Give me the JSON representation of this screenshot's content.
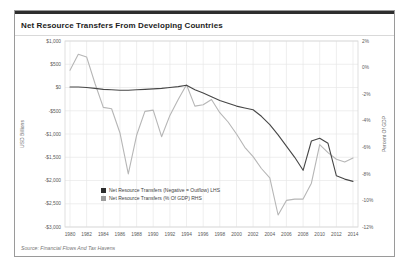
{
  "card": {
    "title": "Net Resource Transfers From Developing Countries",
    "source_note": "Source: Financial Flows And Tax Havens",
    "accent_color": "#2e2e2e",
    "border_color": "#9a9a9a"
  },
  "chart_data": {
    "type": "line",
    "title": "Net Resource Transfers From Developing Countries",
    "grid": true,
    "legend_position": "inside-lower-left",
    "x": [
      1980,
      1981,
      1982,
      1983,
      1984,
      1985,
      1986,
      1987,
      1988,
      1989,
      1990,
      1991,
      1992,
      1993,
      1994,
      1995,
      1996,
      1997,
      1998,
      1999,
      2000,
      2001,
      2002,
      2003,
      2004,
      2005,
      2006,
      2007,
      2008,
      2009,
      2010,
      2011,
      2012,
      2013,
      2014
    ],
    "x_tick_labels": [
      "1980",
      "1982",
      "1984",
      "1986",
      "1988",
      "1990",
      "1992",
      "1994",
      "1996",
      "1998",
      "2000",
      "2002",
      "2004",
      "2006",
      "2008",
      "2010",
      "2012",
      "2014"
    ],
    "left_axis": {
      "title": "USD Billions",
      "tick_labels": [
        "$1,000",
        "$500",
        "$0",
        "-$500",
        "-$1,000",
        "-$1,500",
        "-$2,000",
        "-$2,500",
        "-$3,000"
      ],
      "tick_values": [
        1000,
        500,
        0,
        -500,
        -1000,
        -1500,
        -2000,
        -2500,
        -3000
      ],
      "max": 1000,
      "min": -3000
    },
    "right_axis": {
      "title": "Percent Of GDP",
      "tick_labels": [
        "2%",
        "0%",
        "-2%",
        "-4%",
        "-6%",
        "-8%",
        "-10%",
        "-12%"
      ],
      "tick_values": [
        2,
        0,
        -2,
        -4,
        -6,
        -8,
        -10,
        -12
      ],
      "max": 2,
      "min": -12
    },
    "series": [
      {
        "name": "Net Resource Transfers (Negative = Outflow) LHS",
        "axis": "left",
        "unit": "USD billions",
        "color": "#474747",
        "values": [
          10,
          10,
          0,
          -20,
          -40,
          -50,
          -60,
          -60,
          -50,
          -40,
          -30,
          -20,
          0,
          20,
          50,
          -50,
          -120,
          -200,
          -280,
          -340,
          -400,
          -440,
          -480,
          -620,
          -800,
          -1020,
          -1260,
          -1500,
          -1780,
          -1150,
          -1090,
          -1200,
          -1900,
          -1970,
          -2020
        ]
      },
      {
        "name": "Net Resource Transfers (% Of GDP) RHS",
        "axis": "right",
        "unit": "percent of GDP",
        "color": "#b6b6b6",
        "values": [
          -0.2,
          1.0,
          0.8,
          -1.2,
          -3.0,
          -3.1,
          -4.9,
          -8.0,
          -5.1,
          -3.3,
          -3.2,
          -5.2,
          -3.6,
          -2.4,
          -1.3,
          -2.9,
          -2.8,
          -2.4,
          -3.4,
          -4.1,
          -5.0,
          -6.0,
          -6.7,
          -7.6,
          -8.3,
          -11.1,
          -10.0,
          -9.9,
          -9.9,
          -8.7,
          -5.8,
          -6.4,
          -6.9,
          -7.1,
          -6.8
        ]
      }
    ],
    "legend": [
      {
        "label": "Net Resource Transfers (Negative = Outflow) LHS",
        "swatch_color": "#2d2d2d"
      },
      {
        "label": "Net Resource Transfers (% Of GDP) RHS",
        "swatch_color": "#9c9c9c"
      }
    ],
    "style": {
      "grid_color": "#e8e8e8",
      "plot_border_color": "#d8d8d8",
      "tick_text_color": "#5a5a5a",
      "axis_title_color": "#6a6a6a",
      "legend_text_color": "#444444"
    }
  }
}
